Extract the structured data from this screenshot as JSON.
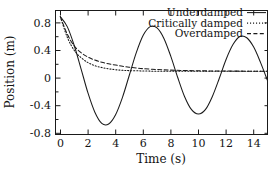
{
  "chart_data": {
    "type": "line",
    "title": "",
    "xlabel": "Time (s)",
    "ylabel": "Position (m)",
    "xlim": [
      -0.35,
      15.0
    ],
    "ylim": [
      -1.0,
      1.0
    ],
    "xticks": [
      0,
      2,
      4,
      6,
      8,
      10,
      12,
      14
    ],
    "xtick_labels": [
      "0",
      "2",
      "4",
      "6",
      "8",
      "10",
      "12",
      "14"
    ],
    "yticks": [
      0.8,
      0.4,
      0,
      -0.4,
      -0.8
    ],
    "ytick_labels": [
      "0.8",
      "0.4",
      "0",
      "-0.4",
      "-0.8"
    ],
    "grid": false,
    "legend_position": "upper right",
    "frame_color": "#1a1a1a",
    "background": "#ffffff",
    "series": [
      {
        "name": "Underdamped",
        "style": "solid",
        "color": "#1a1a1a",
        "description": "Decaying sinusoid, amplitude envelope 0.9*exp(-0.105*t), angular frequency about 1.02 rad/s",
        "x": [
          0,
          0.5,
          1,
          1.5,
          2,
          2.5,
          3,
          3.5,
          4,
          4.5,
          5,
          5.5,
          6,
          6.5,
          7,
          7.5,
          8,
          8.5,
          9,
          9.5,
          10,
          10.5,
          11,
          11.5,
          12,
          12.5,
          13,
          13.5,
          14,
          14.5,
          15
        ],
        "y": [
          0.9,
          0.74,
          0.44,
          0.06,
          -0.33,
          -0.64,
          -0.82,
          -0.83,
          -0.68,
          -0.4,
          -0.04,
          0.32,
          0.6,
          0.74,
          0.72,
          0.55,
          0.26,
          -0.08,
          -0.39,
          -0.6,
          -0.67,
          -0.6,
          -0.39,
          -0.1,
          0.21,
          0.45,
          0.58,
          0.56,
          0.41,
          0.16,
          -0.13
        ]
      },
      {
        "name": "Critically damped",
        "style": "dotted",
        "color": "#1a1a1a",
        "description": "Critically damped decay 0.9*(1+0.55*t)*exp(-1.05*t) approaching zero",
        "x": [
          0,
          0.5,
          1,
          1.5,
          2,
          2.5,
          3,
          3.5,
          4,
          4.5,
          5,
          6,
          7,
          8,
          9,
          10,
          11,
          12,
          13,
          14,
          15
        ],
        "y": [
          0.9,
          0.57,
          0.36,
          0.24,
          0.16,
          0.11,
          0.08,
          0.06,
          0.045,
          0.035,
          0.03,
          0.025,
          0.02,
          0.02,
          0.02,
          0.02,
          0.02,
          0.02,
          0.02,
          0.02,
          0.02
        ]
      },
      {
        "name": "Overdamped",
        "style": "dashed",
        "color": "#1a1a1a",
        "description": "Overdamped decay, slower approach to zero than critically damped",
        "x": [
          0,
          0.5,
          1,
          1.5,
          2,
          2.5,
          3,
          3.5,
          4,
          4.5,
          5,
          5.5,
          6,
          7,
          8,
          9,
          10,
          11,
          12,
          13,
          14,
          15
        ],
        "y": [
          0.9,
          0.62,
          0.43,
          0.32,
          0.25,
          0.2,
          0.165,
          0.14,
          0.12,
          0.1,
          0.085,
          0.072,
          0.062,
          0.048,
          0.038,
          0.032,
          0.028,
          0.025,
          0.023,
          0.022,
          0.021,
          0.02
        ]
      }
    ],
    "legend": [
      {
        "label": "Underdamped",
        "style": "solid"
      },
      {
        "label": "Critically damped",
        "style": "dotted"
      },
      {
        "label": "Overdamped",
        "style": "dashed"
      }
    ]
  }
}
